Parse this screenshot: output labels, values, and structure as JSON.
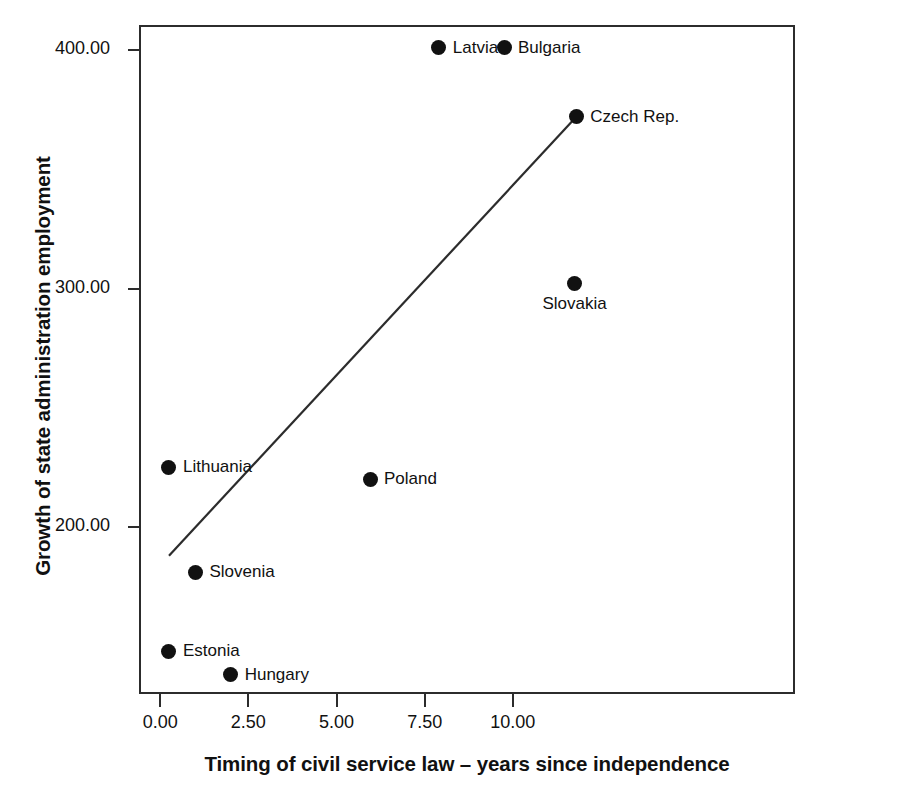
{
  "chart_data": {
    "type": "scatter",
    "title": "",
    "xlabel": "Timing of civil service law – years since independence",
    "ylabel": "Growth of state administration employment",
    "xlim": [
      -0.6,
      18.0
    ],
    "ylim": [
      130.0,
      410.5
    ],
    "grid": false,
    "legend": "none",
    "xticks": [
      "0.00",
      "2.50",
      "5.00",
      "7.50",
      "10.00"
    ],
    "xtick_values": [
      0.0,
      2.5,
      5.0,
      7.5,
      10.0
    ],
    "yticks": [
      "400.00",
      "300.00",
      "200.00"
    ],
    "ytick_values": [
      400.0,
      300.0,
      200.0
    ],
    "points": [
      {
        "label": "Latvia",
        "x": 7.9,
        "y": 401,
        "label_pos": "right"
      },
      {
        "label": "Bulgaria",
        "x": 9.75,
        "y": 401,
        "label_pos": "right"
      },
      {
        "label": "Czech Rep.",
        "x": 11.8,
        "y": 372,
        "label_pos": "right"
      },
      {
        "label": "Slovakia",
        "x": 11.75,
        "y": 302,
        "label_pos": "below"
      },
      {
        "label": "Lithuania",
        "x": 0.25,
        "y": 225,
        "label_pos": "right"
      },
      {
        "label": "Poland",
        "x": 5.95,
        "y": 220,
        "label_pos": "right"
      },
      {
        "label": "Slovenia",
        "x": 1.0,
        "y": 181,
        "label_pos": "right"
      },
      {
        "label": "Estonia",
        "x": 0.25,
        "y": 148,
        "label_pos": "right"
      },
      {
        "label": "Hungary",
        "x": 2.0,
        "y": 138,
        "label_pos": "right"
      }
    ],
    "fit_line": {
      "name": "linear fit",
      "x": [
        0.25,
        11.8
      ],
      "y": [
        188,
        372
      ]
    },
    "colors": {
      "marker": "#111111",
      "line": "#2c2c2c",
      "axis": "#2c2c2c",
      "background": "#ffffff"
    }
  }
}
